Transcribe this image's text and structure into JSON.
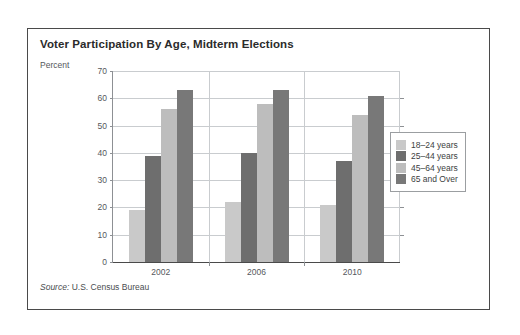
{
  "figure": {
    "title": "Voter Participation By Age, Midterm Elections",
    "source_prefix": "Source:",
    "source_text": " U.S. Census Bureau"
  },
  "legend": {
    "items": [
      {
        "label": "18–24 years",
        "color": "#c9c9c9"
      },
      {
        "label": "25–44 years",
        "color": "#6e6e6e"
      },
      {
        "label": "45–64 years",
        "color": "#bdbdbd"
      },
      {
        "label": "65 and Over",
        "color": "#787878"
      }
    ]
  },
  "chart_data": {
    "type": "bar",
    "title": "Voter Participation By Age, Midterm Elections",
    "xlabel": "",
    "ylabel": "Percent",
    "ylim": [
      0,
      70
    ],
    "yticks": [
      0,
      10,
      20,
      30,
      40,
      50,
      60,
      70
    ],
    "ytick_labels": [
      "0",
      "10",
      "20",
      "30",
      "40",
      "50",
      "60",
      "70"
    ],
    "grid": true,
    "legend_position": "right",
    "categories": [
      "2002",
      "2006",
      "2010"
    ],
    "series": [
      {
        "name": "18–24 years",
        "color": "#c9c9c9",
        "values": [
          19,
          22,
          21
        ]
      },
      {
        "name": "25–44 years",
        "color": "#6e6e6e",
        "values": [
          39,
          40,
          37
        ]
      },
      {
        "name": "45–64 years",
        "color": "#bdbdbd",
        "values": [
          56,
          58,
          54
        ]
      },
      {
        "name": "65 and Over",
        "color": "#787878",
        "values": [
          63,
          63,
          61
        ]
      }
    ]
  }
}
